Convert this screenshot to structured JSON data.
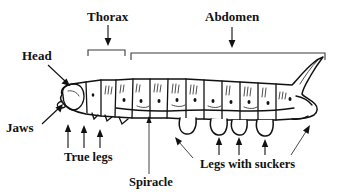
{
  "figure": {
    "background_color": "#ffffff",
    "ink_color": "#111111",
    "bracket_color": "#3a3a3a"
  },
  "labels": {
    "thorax": "Thorax",
    "abdomen": "Abdomen",
    "head": "Head",
    "jaws": "Jaws",
    "true_legs": "True legs",
    "spiracle": "Spiracle",
    "legs_with_suckers": "Legs with suckers"
  },
  "annotations": [
    {
      "id": "thorax",
      "label": "Thorax",
      "marker": "down-arrow-over-bracket",
      "position": "top-left-center"
    },
    {
      "id": "abdomen",
      "label": "Abdomen",
      "marker": "down-arrow-over-bracket",
      "position": "top-right"
    },
    {
      "id": "head",
      "label": "Head",
      "marker": "diagonal-arrow-down-right",
      "position": "left-upper"
    },
    {
      "id": "jaws",
      "label": "Jaws",
      "marker": "diagonal-arrow-up-right",
      "position": "left-lower"
    },
    {
      "id": "true-legs",
      "label": "True legs",
      "marker": "three-up-arrows",
      "position": "bottom-left"
    },
    {
      "id": "spiracle",
      "label": "Spiracle",
      "marker": "vertical-leader-line",
      "position": "bottom-center"
    },
    {
      "id": "legs-with-suckers",
      "label": "Legs with suckers",
      "marker": "three-up-arrows-and-two-diagonal-arrows",
      "position": "bottom-right"
    }
  ],
  "counts": {
    "true_leg_arrows": 3,
    "sucker_leg_arrows": 3,
    "diagonal_sucker_arrows": 2
  }
}
